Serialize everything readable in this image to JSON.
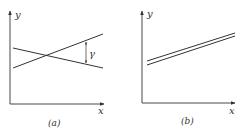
{
  "panels": [
    {
      "id": "a",
      "caption": "(a)",
      "x_axis_label": "x",
      "y_axis_label": "y",
      "annotation": "γ",
      "description": "Two lines crossing at a large angle; vertical double-arrow labeled γ marks their separation on the right"
    },
    {
      "id": "b",
      "caption": "(b)",
      "x_axis_label": "x",
      "y_axis_label": "y",
      "description": "Two nearly parallel rising lines crossing at a very small angle"
    }
  ],
  "colors": {
    "ink": "#333333",
    "background": "#ffffff"
  }
}
